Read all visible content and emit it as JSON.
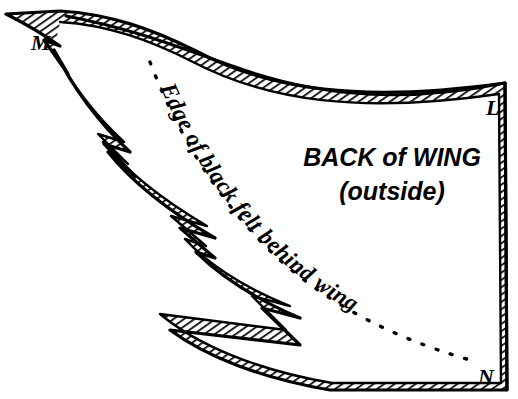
{
  "figure": {
    "background_color": "#ffffff",
    "ink_color": "#000000"
  },
  "labels": {
    "corner_m": "M",
    "corner_l": "L",
    "corner_n": "N"
  },
  "captions": {
    "main": "BACK of WING",
    "sub": "(outside)",
    "curve_label": "Edge of black felt behind wing"
  },
  "styles": {
    "hatch_fill": "#000000",
    "outline_color": "#000000",
    "dotted_line_color": "#000000"
  }
}
